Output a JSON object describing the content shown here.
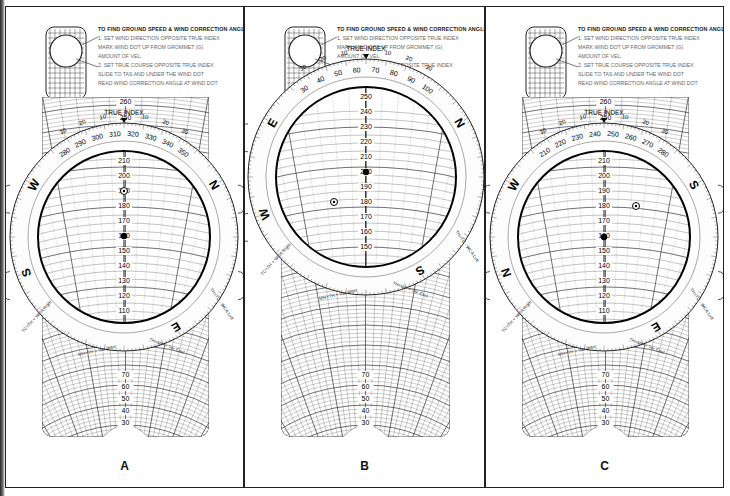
{
  "figure": {
    "panels": [
      {
        "id": "A",
        "label": "A",
        "outer_scale_top_numbers": [
          "280",
          "290",
          "300",
          "310",
          "320",
          "330",
          "340",
          "350"
        ],
        "true_index_course": "290",
        "cardinal_letters_visible": [
          "W",
          "N",
          "S",
          "E"
        ],
        "grid_labels_visible": [
          "210",
          "200",
          "190",
          "180",
          "170",
          "160",
          "150",
          "140",
          "130",
          "120",
          "110",
          "70",
          "60",
          "50",
          "40",
          "30"
        ],
        "top_arc_labels": [
          "260",
          "250"
        ],
        "pin_mark_speed": "160",
        "wind_dot_speed": "190"
      },
      {
        "id": "B",
        "label": "B",
        "outer_scale_top_numbers": [
          "30",
          "40",
          "50",
          "60",
          "70",
          "80",
          "90",
          "100"
        ],
        "true_index_course": "70",
        "cardinal_letters_visible": [
          "E",
          "N",
          "W",
          "S"
        ],
        "grid_labels_visible": [
          "250",
          "240",
          "230",
          "220",
          "210",
          "200",
          "190",
          "180",
          "170",
          "160",
          "150",
          "110",
          "100",
          "90",
          "80",
          "70",
          "60",
          "50",
          "40",
          "30"
        ],
        "pin_mark_speed": "200",
        "wind_dot_speed": "180"
      },
      {
        "id": "C",
        "label": "C",
        "outer_scale_top_numbers": [
          "210",
          "220",
          "230",
          "240",
          "250",
          "260",
          "270",
          "280"
        ],
        "true_index_course": "245",
        "cardinal_letters_visible": [
          "W",
          "S",
          "N",
          "E"
        ],
        "grid_labels_visible": [
          "210",
          "200",
          "190",
          "180",
          "170",
          "160",
          "150",
          "140",
          "130",
          "120",
          "110",
          "70",
          "60",
          "50",
          "40",
          "30"
        ],
        "top_arc_labels": [
          "260",
          "250"
        ],
        "pin_mark_speed": "155",
        "wind_dot_speed": "180"
      }
    ],
    "instructions_box": {
      "title": "TO FIND GROUND SPEED & WIND CORRECTION ANGLE",
      "lines": [
        "1. SET WIND DIRECTION OPPOSITE TRUE INDEX",
        "MARK WIND DOT UP FROM GROMMET (G)",
        "AMOUNT OF VEL.",
        "2. SET TRUE COURSE OPPOSITE TRUE INDEX",
        "SLIDE TO TAS AND UNDER THE WIND DOT",
        "READ GROUND SPEED UNDER GROMMET (G)",
        "READ WIND CORRECTION ANGLE AT WIND DOT"
      ]
    },
    "true_index_label": "TRUE INDEX",
    "wca_labels": {
      "left": "WCA LEFT  VAR EAST",
      "right": "VAR WEST  WCA RIGHT"
    },
    "ring_footer_text": [
      "TH=TC - WCA Left",
      "TH=MH + Var East",
      "MH=TH + Var West",
      "TC=TH + WCA Right"
    ],
    "side_ticks": [
      "10",
      "20",
      "30",
      "40",
      "50"
    ],
    "colors": {
      "ink": "#111111",
      "paper": "#ffffff",
      "grid": "#2a2a2a",
      "ring": "#fdfdfd"
    }
  }
}
